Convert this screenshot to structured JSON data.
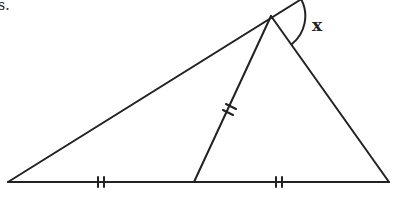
{
  "diagram": {
    "type": "geometry-triangle",
    "caption_fragment": "s.",
    "angle_label": "x",
    "stroke_color": "#222222",
    "background": "#ffffff",
    "points": {
      "left_vertex": [
        8,
        182
      ],
      "base_midpoint": [
        194,
        182
      ],
      "right_vertex": [
        389,
        182
      ],
      "apex": [
        271,
        16
      ]
    },
    "equal_segment_marks": {
      "left_base_segment": "double-tick",
      "right_base_segment": "double-tick",
      "median_segment": "double-tick"
    }
  }
}
